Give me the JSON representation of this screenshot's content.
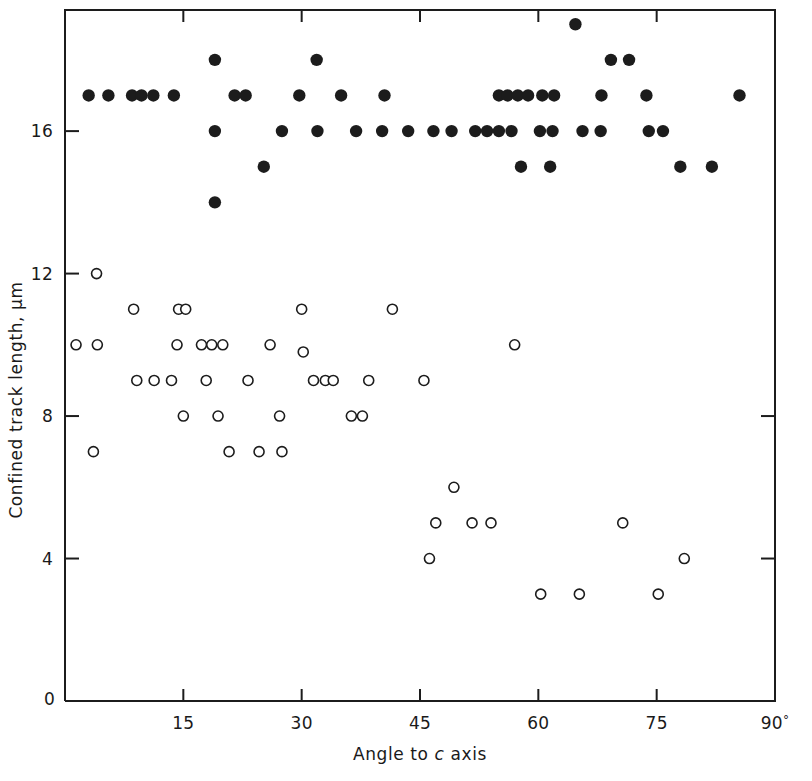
{
  "figure": {
    "background_color": "#ffffff",
    "ink_color": "#1c1c1c"
  },
  "chart_data": {
    "type": "scatter",
    "title": "",
    "xlabel": "Angle to c axis",
    "ylabel": "Confined track length, μm",
    "xlim": [
      0,
      90
    ],
    "ylim": [
      0,
      19.4
    ],
    "grid": false,
    "legend": null,
    "xticks": [
      0,
      15,
      30,
      45,
      60,
      75,
      90
    ],
    "xticklabels": [
      "0",
      "15",
      "30",
      "45",
      "60",
      "75",
      "90°"
    ],
    "yticks": [
      0,
      4,
      8,
      12,
      16
    ],
    "yticklabels": [
      "0",
      "4",
      "8",
      "12",
      "16"
    ],
    "series": [
      {
        "name": "filled-circles",
        "marker": "filled-circle",
        "color": "#1c1c1c",
        "points": [
          [
            3.0,
            17.0
          ],
          [
            5.5,
            17.0
          ],
          [
            8.5,
            17.0
          ],
          [
            9.7,
            17.0
          ],
          [
            11.2,
            17.0
          ],
          [
            13.8,
            17.0
          ],
          [
            19.0,
            18.0
          ],
          [
            19.0,
            16.0
          ],
          [
            19.0,
            14.0
          ],
          [
            21.5,
            17.0
          ],
          [
            22.9,
            17.0
          ],
          [
            25.2,
            15.0
          ],
          [
            27.5,
            16.0
          ],
          [
            29.7,
            17.0
          ],
          [
            31.9,
            18.0
          ],
          [
            32.0,
            16.0
          ],
          [
            35.0,
            17.0
          ],
          [
            36.9,
            16.0
          ],
          [
            40.5,
            17.0
          ],
          [
            40.2,
            16.0
          ],
          [
            43.5,
            16.0
          ],
          [
            46.7,
            16.0
          ],
          [
            49.0,
            16.0
          ],
          [
            52.0,
            16.0
          ],
          [
            53.5,
            16.0
          ],
          [
            55.0,
            17.0
          ],
          [
            56.1,
            17.0
          ],
          [
            57.4,
            17.0
          ],
          [
            58.7,
            17.0
          ],
          [
            57.8,
            15.0
          ],
          [
            55.0,
            16.0
          ],
          [
            56.6,
            16.0
          ],
          [
            60.5,
            17.0
          ],
          [
            62.0,
            17.0
          ],
          [
            60.2,
            16.0
          ],
          [
            61.8,
            16.0
          ],
          [
            61.5,
            15.0
          ],
          [
            64.7,
            19.0
          ],
          [
            65.6,
            16.0
          ],
          [
            67.9,
            16.0
          ],
          [
            69.2,
            18.0
          ],
          [
            68.0,
            17.0
          ],
          [
            71.5,
            18.0
          ],
          [
            73.7,
            17.0
          ],
          [
            74.0,
            16.0
          ],
          [
            75.8,
            16.0
          ],
          [
            78.0,
            15.0
          ],
          [
            82.0,
            15.0
          ],
          [
            85.5,
            17.0
          ]
        ]
      },
      {
        "name": "open-circles",
        "marker": "open-circle",
        "color": "#1c1c1c",
        "points": [
          [
            1.4,
            10.0
          ],
          [
            4.0,
            12.0
          ],
          [
            4.1,
            10.0
          ],
          [
            3.6,
            7.0
          ],
          [
            8.7,
            11.0
          ],
          [
            9.1,
            9.0
          ],
          [
            11.3,
            9.0
          ],
          [
            14.4,
            11.0
          ],
          [
            15.3,
            11.0
          ],
          [
            14.2,
            10.0
          ],
          [
            13.5,
            9.0
          ],
          [
            15.0,
            8.0
          ],
          [
            17.3,
            10.0
          ],
          [
            18.6,
            10.0
          ],
          [
            20.0,
            10.0
          ],
          [
            17.9,
            9.0
          ],
          [
            19.4,
            8.0
          ],
          [
            20.8,
            7.0
          ],
          [
            23.2,
            9.0
          ],
          [
            24.6,
            7.0
          ],
          [
            26.0,
            10.0
          ],
          [
            27.5,
            7.0
          ],
          [
            27.2,
            8.0
          ],
          [
            30.0,
            11.0
          ],
          [
            30.2,
            9.8
          ],
          [
            31.5,
            9.0
          ],
          [
            33.0,
            9.0
          ],
          [
            34.0,
            9.0
          ],
          [
            36.3,
            8.0
          ],
          [
            37.7,
            8.0
          ],
          [
            38.5,
            9.0
          ],
          [
            41.5,
            11.0
          ],
          [
            45.5,
            9.0
          ],
          [
            46.2,
            4.0
          ],
          [
            47.0,
            5.0
          ],
          [
            49.3,
            6.0
          ],
          [
            51.6,
            5.0
          ],
          [
            54.0,
            5.0
          ],
          [
            57.0,
            10.0
          ],
          [
            60.3,
            3.0
          ],
          [
            65.2,
            3.0
          ],
          [
            70.7,
            5.0
          ],
          [
            75.2,
            3.0
          ],
          [
            78.5,
            4.0
          ]
        ]
      }
    ]
  },
  "plot_geometry": {
    "left_px": 65,
    "right_px": 775,
    "top_px": 10,
    "bottom_px": 701
  }
}
